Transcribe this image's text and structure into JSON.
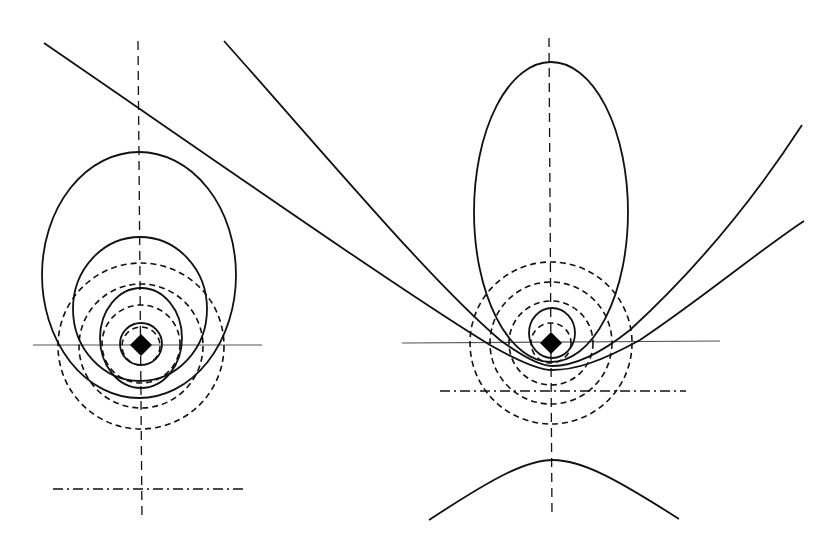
{
  "diagram": {
    "width": 828,
    "height": 548,
    "background": "#ffffff",
    "stroke": "#111111",
    "axis_stroke": "#555555",
    "left_figure": {
      "name": "ellipses-family",
      "focus": {
        "x": 141,
        "y": 345,
        "size": 11
      },
      "vertical_axis": {
        "x1": 138,
        "y1": 41,
        "x2": 142,
        "y2": 520
      },
      "horizontal_axis": {
        "x1": 33,
        "y1": 345,
        "x2": 262,
        "y2": 345
      },
      "directrix": {
        "x1": 53,
        "y1": 489,
        "x2": 243,
        "y2": 489
      },
      "solid_conics": [
        {
          "cx": 139,
          "cy": 275,
          "rx": 97,
          "ry": 123
        },
        {
          "cx": 140,
          "cy": 309,
          "rx": 67,
          "ry": 72
        },
        {
          "cx": 141,
          "cy": 338,
          "rx": 41,
          "ry": 50
        },
        {
          "cx": 141,
          "cy": 344,
          "rx": 21,
          "ry": 21
        }
      ],
      "dashed_circles": [
        {
          "cx": 141,
          "cy": 346,
          "r": 83
        },
        {
          "cx": 141,
          "cy": 346,
          "r": 62
        },
        {
          "cx": 141,
          "cy": 344,
          "r": 39
        },
        {
          "cx": 141,
          "cy": 346,
          "r": 19
        }
      ]
    },
    "right_figure": {
      "name": "ellipse-parabola-hyperbola-family",
      "focus": {
        "x": 551,
        "y": 343,
        "size": 11
      },
      "vertical_axis": {
        "x1": 549,
        "y1": 38,
        "x2": 552,
        "y2": 518
      },
      "horizontal_axis": {
        "x1": 402,
        "y1": 343,
        "x2": 720,
        "y2": 341
      },
      "directrix": {
        "x1": 440,
        "y1": 391,
        "x2": 686,
        "y2": 391
      },
      "solid_ellipses": [
        {
          "cx": 551,
          "cy": 212,
          "rx": 77,
          "ry": 150
        },
        {
          "cx": 552,
          "cy": 333,
          "rx": 23,
          "ry": 25
        }
      ],
      "dashed_circles": [
        {
          "cx": 551,
          "cy": 343,
          "r": 81
        },
        {
          "cx": 551,
          "cy": 343,
          "r": 61
        },
        {
          "cx": 551,
          "cy": 343,
          "r": 42
        },
        {
          "cx": 551,
          "cy": 343,
          "r": 20
        }
      ],
      "hyperbola_paths": [
        {
          "name": "steep-hyperbola-upper-branch",
          "d": "M 224 41 C 330 160, 430 280, 500 340 C 530 362, 545 366, 552 366 C 570 366, 595 358, 630 330 C 690 275, 750 205, 802 125"
        },
        {
          "name": "flat-hyperbola-upper-branch",
          "d": "M 44 43 C 200 150, 400 290, 490 345 C 520 362, 540 370, 552 370 C 575 370, 600 362, 640 340 C 700 300, 760 250, 804 221"
        },
        {
          "name": "hyperbola-lower-branch",
          "d": "M 429 520 C 490 480, 525 460, 553 460 C 581 460, 615 478, 679 519"
        }
      ]
    }
  }
}
